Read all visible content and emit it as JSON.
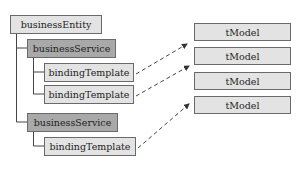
{
  "diagram": {
    "tree": {
      "entity": {
        "label": "businessEntity"
      },
      "services": [
        {
          "label": "businessService",
          "templates": [
            {
              "label": "bindingTemplate"
            },
            {
              "label": "bindingTemplate"
            }
          ]
        },
        {
          "label": "businessService",
          "templates": [
            {
              "label": "bindingTemplate"
            }
          ]
        }
      ]
    },
    "tmodels": [
      {
        "label": "tModel"
      },
      {
        "label": "tModel"
      },
      {
        "label": "tModel"
      },
      {
        "label": "tModel"
      }
    ],
    "colors": {
      "light_fill": "#e3e3e3",
      "dark_fill": "#a9a9a9",
      "border": "#6a6a6a",
      "connector": "#444444"
    }
  }
}
